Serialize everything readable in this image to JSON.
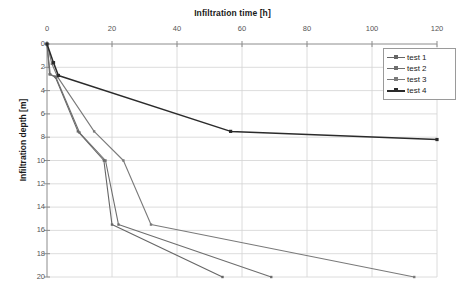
{
  "chart_data": {
    "type": "line",
    "title": "Infiltration time [h]",
    "xlabel": "Infiltration time [h]",
    "ylabel": "Infiltration depth [m]",
    "xlim": [
      0,
      120
    ],
    "ylim": [
      0,
      20
    ],
    "y_inverted": true,
    "grid": true,
    "legend_position": "top-right",
    "x_ticks": [
      0,
      20,
      40,
      60,
      80,
      100,
      120
    ],
    "x_tick_labels": [
      "0",
      "20",
      "40",
      "60",
      "80",
      "100",
      "120"
    ],
    "y_ticks": [
      0,
      2,
      4,
      6,
      8,
      10,
      12,
      14,
      16,
      18,
      20
    ],
    "y_tick_labels": [
      "0",
      "2",
      "4",
      "6",
      "8",
      "10",
      "12",
      "14",
      "16",
      "18",
      "20"
    ],
    "series": [
      {
        "name": "test 1",
        "color": "#666666",
        "marker": "square",
        "x": [
          0,
          0.8,
          2.5,
          9.5,
          17.5,
          20.0,
          54.0
        ],
        "y": [
          0,
          2.6,
          2.8,
          7.5,
          10.0,
          15.5,
          20.0
        ]
      },
      {
        "name": "test 2",
        "color": "#6e6e6e",
        "marker": "square",
        "x": [
          0,
          1.0,
          2.8,
          10.0,
          18.0,
          22.0,
          69.0
        ],
        "y": [
          0,
          2.6,
          2.9,
          7.6,
          10.0,
          15.5,
          20.0
        ]
      },
      {
        "name": "test 3",
        "color": "#7a7a7a",
        "marker": "square",
        "x": [
          0,
          1.5,
          3.2,
          14.5,
          23.5,
          32.0,
          113.0
        ],
        "y": [
          0,
          1.7,
          2.8,
          7.5,
          10.0,
          15.5,
          20.0
        ]
      },
      {
        "name": "test 4",
        "color": "#2b2b2b",
        "marker": "square",
        "x": [
          0,
          2.0,
          3.5,
          56.5,
          120.0
        ],
        "y": [
          0,
          1.6,
          2.7,
          7.5,
          8.2
        ]
      }
    ]
  },
  "legend": {
    "entries": [
      {
        "label": "test 1"
      },
      {
        "label": "test 2"
      },
      {
        "label": "test 3"
      },
      {
        "label": "test 4"
      }
    ]
  },
  "axes": {
    "top_axis_title": "Infiltration time [h]",
    "left_axis_title": "Infiltration depth [m]"
  }
}
